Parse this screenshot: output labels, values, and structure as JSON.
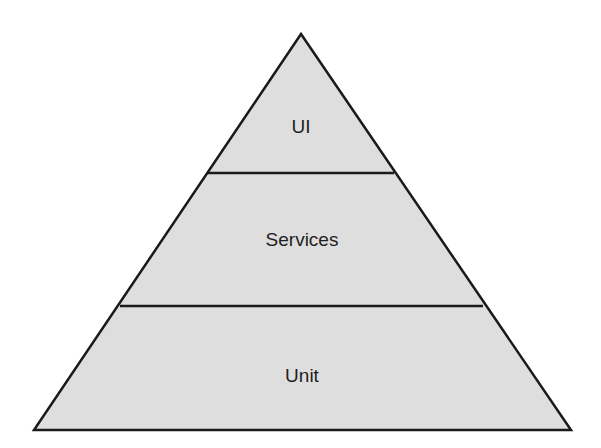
{
  "diagram": {
    "type": "pyramid",
    "fill_color": "#dedede",
    "stroke_color": "#1a1a1a",
    "layers": [
      {
        "label": "UI",
        "cx": 301,
        "cy": 127
      },
      {
        "label": "Services",
        "cx": 302,
        "cy": 240
      },
      {
        "label": "Unit",
        "cx": 302,
        "cy": 376
      }
    ]
  }
}
